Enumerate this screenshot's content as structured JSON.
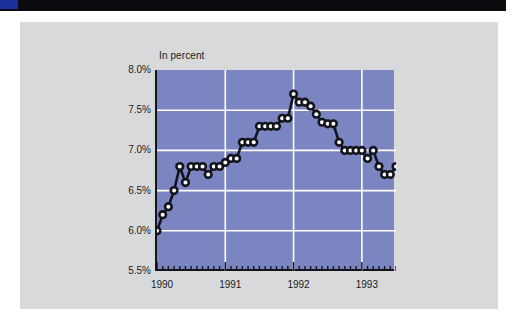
{
  "decor": {
    "top_bar_color": "#0b0b10",
    "top_accent_color": "#1b2f9c",
    "card_color": "#d8d9da"
  },
  "chart_data": {
    "type": "line",
    "title": "",
    "subtitle": "",
    "axis_title": "In percent",
    "xlabel": "",
    "ylabel": "In percent",
    "ylim": [
      5.5,
      8.0
    ],
    "ytick_labels": [
      "8.0%",
      "7.5%",
      "7.0%",
      "6.5%",
      "6.0%",
      "5.5%"
    ],
    "ytick_values": [
      8.0,
      7.5,
      7.0,
      6.5,
      6.0,
      5.5
    ],
    "xtick_labels": [
      "1990",
      "1991",
      "1992",
      "1993"
    ],
    "xtick_values": [
      0,
      12,
      24,
      36
    ],
    "xlim": [
      0,
      42
    ],
    "grid": true,
    "grid_color": "#ffffff",
    "plot_bg": "#7b85c2",
    "line_color": "#14141c",
    "marker_face": "#ffffff",
    "marker_edge": "#14141c",
    "minor_ticks": "monthly",
    "legend": null,
    "x": [
      0,
      1,
      2,
      3,
      4,
      5,
      6,
      7,
      8,
      9,
      10,
      11,
      12,
      13,
      14,
      15,
      16,
      17,
      18,
      19,
      20,
      21,
      22,
      23,
      24,
      25,
      26,
      27,
      28,
      29,
      30,
      31,
      32,
      33,
      34,
      35,
      36,
      37,
      38,
      39,
      40,
      41,
      42
    ],
    "values": [
      6.0,
      6.2,
      6.3,
      6.5,
      6.8,
      6.6,
      6.8,
      6.8,
      6.8,
      6.7,
      6.8,
      6.8,
      6.85,
      6.9,
      6.9,
      7.1,
      7.1,
      7.1,
      7.3,
      7.3,
      7.3,
      7.3,
      7.4,
      7.4,
      7.7,
      7.6,
      7.6,
      7.55,
      7.45,
      7.35,
      7.33,
      7.33,
      7.1,
      7.0,
      7.0,
      7.0,
      7.0,
      6.9,
      7.0,
      6.8,
      6.7,
      6.7,
      6.8
    ],
    "series": [
      {
        "name": "Unemployment rate",
        "values": [
          6.0,
          6.2,
          6.3,
          6.5,
          6.8,
          6.6,
          6.8,
          6.8,
          6.8,
          6.7,
          6.8,
          6.8,
          6.85,
          6.9,
          6.9,
          7.1,
          7.1,
          7.1,
          7.3,
          7.3,
          7.3,
          7.3,
          7.4,
          7.4,
          7.7,
          7.6,
          7.6,
          7.55,
          7.45,
          7.35,
          7.33,
          7.33,
          7.1,
          7.0,
          7.0,
          7.0,
          7.0,
          6.9,
          7.0,
          6.8,
          6.7,
          6.7,
          6.8
        ]
      }
    ]
  }
}
